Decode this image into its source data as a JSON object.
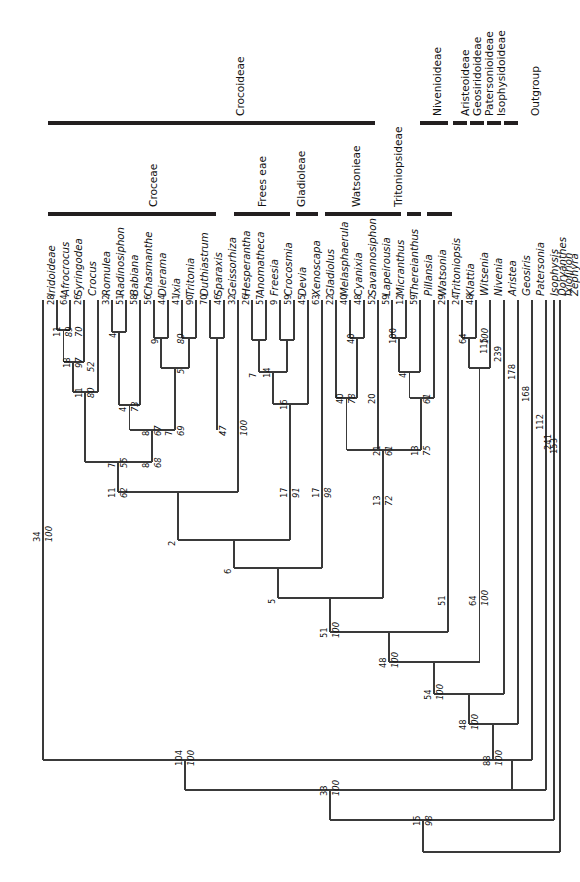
{
  "figure": {
    "type": "phylogenetic-cladogram",
    "orientation": "tips-at-top-rotated-90",
    "family": "Iridaceae"
  },
  "subfamily_bars": {
    "row_label": "subfamily-bar-row",
    "items": [
      {
        "name": "Crocoideae",
        "label": "Crocoideae"
      },
      {
        "name": "Nivenioideae",
        "label": "Nivenioideae"
      },
      {
        "name": "Aristeoideae",
        "label": "Aristeoideae"
      },
      {
        "name": "Geosiridoideae",
        "label": "Geosiridoideae"
      },
      {
        "name": "Patersonioideae",
        "label": "Patersonioideae"
      },
      {
        "name": "Isophysidoideae",
        "label": "Isophysidoideae"
      },
      {
        "name": "Outgroup",
        "label": "Outgroup"
      }
    ]
  },
  "tribe_bars": {
    "row_label": "tribe-bar-row",
    "items": [
      {
        "name": "Croceae",
        "label": "Croceae"
      },
      {
        "name": "Freesieae",
        "label": "Frees eae"
      },
      {
        "name": "Gladioleae",
        "label": "Gladioleae"
      },
      {
        "name": "Watsonieae",
        "label": "Watsonieae"
      },
      {
        "name": "Tritoniopsideae",
        "label": "Tritoniopsideae"
      }
    ]
  },
  "subfamily_left": {
    "label": "Iridoideae"
  },
  "taxa": [
    {
      "label": "Iridoideae",
      "italic": true
    },
    {
      "label": "Afrocrocus",
      "italic": true
    },
    {
      "label": "Syringodea",
      "italic": true
    },
    {
      "label": "Crocus",
      "italic": true
    },
    {
      "label": "Romulea",
      "italic": true
    },
    {
      "label": "Radinosiphon",
      "italic": true
    },
    {
      "label": "Babiana",
      "italic": true
    },
    {
      "label": "Chasmanthe",
      "italic": true
    },
    {
      "label": "Dierama",
      "italic": true
    },
    {
      "label": "Ixia",
      "italic": true
    },
    {
      "label": "Tritonia",
      "italic": true
    },
    {
      "label": "Duthiastrum",
      "italic": true
    },
    {
      "label": "Sparaxis",
      "italic": true
    },
    {
      "label": "Geissorhiza",
      "italic": true
    },
    {
      "label": "Hesperantha",
      "italic": true
    },
    {
      "label": "Anomatheca",
      "italic": true
    },
    {
      "label": "Freesia",
      "italic": true
    },
    {
      "label": "Crocosmia",
      "italic": true
    },
    {
      "label": "Devia",
      "italic": true
    },
    {
      "label": "Xenoscapa",
      "italic": true
    },
    {
      "label": "Gladiolus",
      "italic": true
    },
    {
      "label": "Melasphaerula",
      "italic": true
    },
    {
      "label": "Cyanixia",
      "italic": true
    },
    {
      "label": "Savannosiphon",
      "italic": true
    },
    {
      "label": "Lapeirousia",
      "italic": true
    },
    {
      "label": "Micranthus",
      "italic": true
    },
    {
      "label": "Thereianthus",
      "italic": true
    },
    {
      "label": "Pillansia",
      "italic": true
    },
    {
      "label": "Watsonia",
      "italic": true
    },
    {
      "label": "Tritoniopsis",
      "italic": true
    },
    {
      "label": "Klattia",
      "italic": true
    },
    {
      "label": "Witsenia",
      "italic": true
    },
    {
      "label": "Nivenia",
      "italic": true
    },
    {
      "label": "Aristea",
      "italic": true
    },
    {
      "label": "Geosiris",
      "italic": true
    },
    {
      "label": "Patersonia",
      "italic": true
    },
    {
      "label": "Isophysis",
      "italic": true
    },
    {
      "label": "Doryanthes",
      "italic": true
    },
    {
      "label": "Ixiolirion",
      "italic": true
    },
    {
      "label": "Zephyra",
      "italic": true
    }
  ],
  "terminal_branch_lengths": [
    {
      "taxon": "Afrocrocus",
      "value": "28"
    },
    {
      "taxon": "Syringodea",
      "value": "64"
    },
    {
      "taxon": "Crocus",
      "value": "26"
    },
    {
      "taxon": "Radinosiphon",
      "value": "32"
    },
    {
      "taxon": "Babiana",
      "value": "51"
    },
    {
      "taxon": "Chasmanthe",
      "value": "58"
    },
    {
      "taxon": "Dierama",
      "value": "56"
    },
    {
      "taxon": "Ixia",
      "value": "44"
    },
    {
      "taxon": "Tritonia",
      "value": "41"
    },
    {
      "taxon": "Duthiastrum",
      "value": "90"
    },
    {
      "taxon": "Sparaxis",
      "value": "70"
    },
    {
      "taxon": "Geissorhiza",
      "value": "46"
    },
    {
      "taxon": "Hesperantha",
      "value": "32"
    },
    {
      "taxon": "Anomatheca",
      "value": "26"
    },
    {
      "taxon": "Freesia",
      "value": "57"
    },
    {
      "taxon": "Crocosmia",
      "value": "9"
    },
    {
      "taxon": "Devia",
      "value": "59"
    },
    {
      "taxon": "Xenoscapa",
      "value": "45"
    },
    {
      "taxon": "Gladiolus",
      "value": "63"
    },
    {
      "taxon": "Melasphaerula",
      "value": "22"
    },
    {
      "taxon": "Cyanixia",
      "value": "40"
    },
    {
      "taxon": "Savannosiphon",
      "value": "48"
    },
    {
      "taxon": "Lapeirousia",
      "value": "52"
    },
    {
      "taxon": "Micranthus",
      "value": "59"
    },
    {
      "taxon": "Thereianthus",
      "value": "12"
    },
    {
      "taxon": "Pillansia",
      "value": "59"
    },
    {
      "taxon": "Tritoniopsis",
      "value": "29"
    },
    {
      "taxon": "Klattia",
      "value": "24"
    },
    {
      "taxon": "Witsenia",
      "value": "48"
    },
    {
      "taxon": "Nivenia",
      "value": "115"
    },
    {
      "taxon": "Aristea",
      "value": "239"
    },
    {
      "taxon": "Geosiris",
      "value": "178"
    },
    {
      "taxon": "Patersonia",
      "value": "168"
    },
    {
      "taxon": "Isophysis",
      "value": "112"
    },
    {
      "taxon": "Doryanthes",
      "value": "241"
    },
    {
      "taxon": "Ixiolirion",
      "value": "153"
    }
  ],
  "internal_nodes": [
    {
      "name": "node-afrocrocus-syringodea",
      "support": "11",
      "length": "89"
    },
    {
      "name": "node-crocus",
      "support": "",
      "length": "70"
    },
    {
      "name": "node-crocus-clade",
      "support": "18",
      "length": "97"
    },
    {
      "name": "node-romulea",
      "support": "",
      "length": "52"
    },
    {
      "name": "node-croceae-core",
      "support": "11",
      "length": "80"
    },
    {
      "name": "node-croceae",
      "support": "7",
      "length": "55"
    },
    {
      "name": "node-dierama-ixia",
      "support": "",
      "length": "9"
    },
    {
      "name": "node-tritonia",
      "support": "",
      "length": "80"
    },
    {
      "name": "node-ixieae-a",
      "support": "",
      "length": "5"
    },
    {
      "name": "node-chasmanthe-group",
      "support": "4",
      "length": "73"
    },
    {
      "name": "node-babiana-group",
      "support": "4",
      "length": ""
    },
    {
      "name": "node-ixieae-b",
      "support": "8",
      "length": "67"
    },
    {
      "name": "node-ixieae",
      "support": "7",
      "length": "69"
    },
    {
      "name": "node-ixieae-root",
      "support": "8",
      "length": "68"
    },
    {
      "name": "node-hesperantha-group",
      "support": "47",
      "length": "100"
    },
    {
      "name": "node-croceae-ixieae",
      "support": "11",
      "length": "62"
    },
    {
      "name": "node-freesia-crocosmia",
      "support": "",
      "length": "14"
    },
    {
      "name": "node-anomatheca-group",
      "support": "7",
      "length": ""
    },
    {
      "name": "node-freesieae-core",
      "support": "16",
      "length": ""
    },
    {
      "name": "node-freesieae",
      "support": "17",
      "length": "91"
    },
    {
      "name": "node-upper-crocoid",
      "support": "2",
      "length": ""
    },
    {
      "name": "node-gladioleae",
      "support": "17",
      "length": "98"
    },
    {
      "name": "node-crocoid-6",
      "support": "6",
      "length": ""
    },
    {
      "name": "node-cyanixia-savannosiphon",
      "support": "40",
      "length": "78"
    },
    {
      "name": "node-lapeirousia-group",
      "support": "21",
      "length": "61"
    },
    {
      "name": "node-micranthus-thereianthus",
      "support": "100",
      "length": "4"
    },
    {
      "name": "node-pillansia-watsonia",
      "support": "20",
      "length": "61"
    },
    {
      "name": "node-watsonieae",
      "support": "13",
      "length": "75"
    },
    {
      "name": "node-watsonieae-stem",
      "support": "13",
      "length": "72"
    },
    {
      "name": "node-crocoid-5",
      "support": "5",
      "length": ""
    },
    {
      "name": "node-crocoideae",
      "support": "51",
      "length": "100"
    },
    {
      "name": "node-klattia-witsenia",
      "support": "64",
      "length": "100"
    },
    {
      "name": "node-nivenioideae",
      "support": "51",
      "length": ""
    },
    {
      "name": "node-nivenia-stem",
      "support": "64",
      "length": "100"
    },
    {
      "name": "node-croc-niv",
      "support": "48",
      "length": "100"
    },
    {
      "name": "node-aristea",
      "support": "54",
      "length": "100"
    },
    {
      "name": "node-geosiris",
      "support": "48",
      "length": "100"
    },
    {
      "name": "node-patersonia",
      "support": "88",
      "length": "100"
    },
    {
      "name": "node-iridoideae",
      "support": "34",
      "length": "100"
    },
    {
      "name": "node-iridaceae",
      "support": "104",
      "length": "100"
    },
    {
      "name": "node-isophysis",
      "support": "33",
      "length": "100"
    },
    {
      "name": "node-root",
      "support": "15",
      "length": "98"
    }
  ],
  "colors": {
    "line": "#3a3a3a",
    "bar": "#231f20",
    "text": "#111111"
  }
}
